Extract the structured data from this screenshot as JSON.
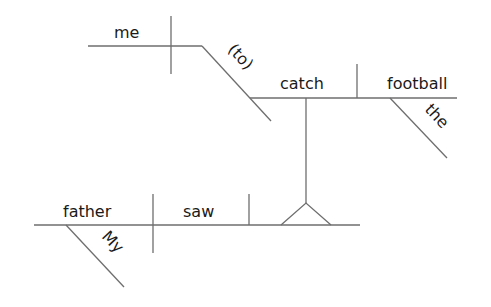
{
  "diagram": {
    "type": "sentence-diagram",
    "style": "Reed-Kellogg",
    "sentence": "My father saw me (to) catch the football.",
    "line_color": "#6e6e6e",
    "text_color": "#1a1a1a",
    "words": {
      "subject": "father",
      "subject_modifier": "My",
      "verb": "saw",
      "infinitive_subject": "me",
      "infinitive_marker": "(to)",
      "infinitive_verb": "catch",
      "infinitive_object": "football",
      "object_modifier": "the"
    }
  }
}
